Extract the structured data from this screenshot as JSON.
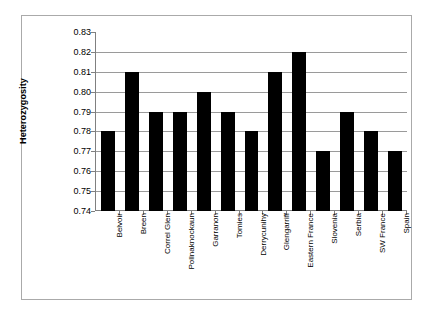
{
  "chart_data": {
    "type": "bar",
    "title": "",
    "xlabel": "",
    "ylabel": "Heterozygosity",
    "ylim": [
      0.74,
      0.83
    ],
    "ytick_step": 0.01,
    "grid": true,
    "legend": "none",
    "bar_color": "#000000",
    "background_color": "#ffffff",
    "gridline_color": "#9a9a9a",
    "axis_color": "#808080",
    "yticks": [
      "0.83",
      "0.82",
      "0.81",
      "0.80",
      "0.79",
      "0.78",
      "0.77",
      "0.76",
      "0.75",
      "0.74"
    ],
    "categories": [
      "Belvoir",
      "Breen",
      "Correl Glen",
      "Pollnaknockaun",
      "Garranon",
      "Tomies",
      "Derrycunihy",
      "Glengarriff",
      "Eastern France",
      "Slovenia",
      "Serbia",
      "SW France",
      "Spain"
    ],
    "values": [
      0.78,
      0.81,
      0.79,
      0.79,
      0.8,
      0.79,
      0.78,
      0.81,
      0.82,
      0.77,
      0.79,
      0.78,
      0.77
    ]
  }
}
